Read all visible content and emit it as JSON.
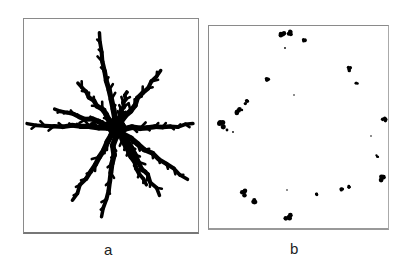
{
  "figure": {
    "panels": [
      {
        "id": "a",
        "label": "a",
        "content": "dendritic star-shaped aggregate with branched arms radiating from a dense center"
      },
      {
        "id": "b",
        "label": "b",
        "content": "sparse small clusters scattered roughly on a ring"
      }
    ]
  }
}
